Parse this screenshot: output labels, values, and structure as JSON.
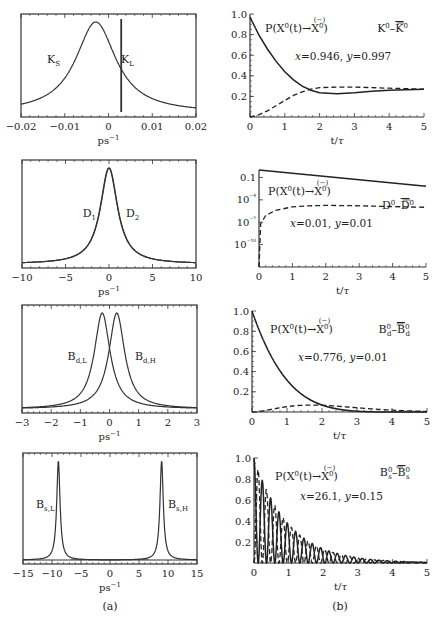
{
  "figure": {
    "caption_a": "(a)",
    "caption_b": "(b)"
  },
  "chart_data": [
    {
      "id": "a1",
      "type": "line",
      "panel": "(a)",
      "xlabel": "ps⁻¹",
      "ylabel": "",
      "xlim": [
        -0.02,
        0.02
      ],
      "xticks": [
        -0.02,
        -0.01,
        0,
        0.01,
        0.02
      ],
      "xtick_labels": [
        "−0.02",
        "−0.01",
        "0",
        "0.01",
        "0.02"
      ],
      "grid": false,
      "series": [
        {
          "name": "K_S",
          "label": "K",
          "sub": "S",
          "kind": "lorentzian",
          "center": -0.0029,
          "halfwidth": 0.0056
        },
        {
          "name": "K_L",
          "label": "K",
          "sub": "L",
          "kind": "lorentzian",
          "center": 0.0029,
          "halfwidth": 1e-05
        }
      ]
    },
    {
      "id": "b1",
      "type": "line",
      "panel": "(b)",
      "title": "K⁰–K̄⁰",
      "formula": "P(X⁰(t)→X⁰)",
      "params": "x=0.946, y=0.997",
      "xlabel": "t/τ",
      "xlim": [
        0,
        5
      ],
      "ylim": [
        0,
        1.0
      ],
      "xticks": [
        0,
        1,
        2,
        3,
        4,
        5
      ],
      "yticks": [
        0.2,
        0.4,
        0.6,
        0.8,
        1.0
      ],
      "ytick_labels": [
        "0.2",
        "0.4",
        "0.6",
        "0.8",
        "1.0"
      ],
      "series": [
        {
          "name": "P(X⁰→X⁰)",
          "style": "solid",
          "x": [
            0,
            0.25,
            0.5,
            0.75,
            1.0,
            1.25,
            1.5,
            1.75,
            2.0,
            2.5,
            3.0,
            3.5,
            4.0,
            4.5,
            5.0
          ],
          "y": [
            0.97,
            0.8,
            0.66,
            0.54,
            0.44,
            0.36,
            0.3,
            0.26,
            0.235,
            0.225,
            0.235,
            0.25,
            0.26,
            0.265,
            0.27
          ]
        },
        {
          "name": "P(X⁰→X̄⁰)",
          "style": "dashed",
          "x": [
            0,
            0.25,
            0.5,
            0.75,
            1.0,
            1.25,
            1.5,
            1.75,
            2.0,
            2.5,
            3.0,
            3.5,
            4.0,
            4.5,
            5.0
          ],
          "y": [
            0.0,
            0.02,
            0.06,
            0.11,
            0.16,
            0.21,
            0.245,
            0.27,
            0.285,
            0.29,
            0.29,
            0.285,
            0.28,
            0.275,
            0.27
          ]
        }
      ]
    },
    {
      "id": "a2",
      "type": "line",
      "panel": "(a)",
      "xlabel": "ps⁻¹",
      "xlim": [
        -10,
        10
      ],
      "xticks": [
        -10,
        -5,
        0,
        5,
        10
      ],
      "xtick_labels": [
        "−10",
        "−5",
        "0",
        "5",
        "10"
      ],
      "series": [
        {
          "name": "D_1",
          "label": "D",
          "sub": "1",
          "kind": "lorentzian",
          "center": -0.02,
          "halfwidth": 1.2
        },
        {
          "name": "D_2",
          "label": "D",
          "sub": "2",
          "kind": "lorentzian",
          "center": 0.02,
          "halfwidth": 1.2
        }
      ]
    },
    {
      "id": "b2",
      "type": "line",
      "panel": "(b)",
      "title": "D⁰–D̄⁰",
      "formula": "P(X⁰(t)→X⁰)",
      "params": "x=0.01, y=0.01",
      "xlabel": "t/τ",
      "yscale": "log",
      "xlim": [
        0,
        5
      ],
      "ylim_log10": [
        -13,
        0
      ],
      "xticks": [
        0,
        1,
        2,
        3,
        4,
        5
      ],
      "yticks_log10": [
        -1,
        -4,
        -7,
        -10
      ],
      "ytick_labels": [
        "0.1",
        "10⁻⁴",
        "10⁻⁷",
        "10⁻¹⁰"
      ],
      "series": [
        {
          "name": "P(X⁰→X⁰)",
          "style": "solid",
          "x": [
            0,
            5
          ],
          "log10_y": [
            0,
            -2.17
          ]
        },
        {
          "name": "P(X⁰→X̄⁰)",
          "style": "dashed",
          "x": [
            0,
            0.05,
            0.2,
            0.5,
            1.0,
            1.5,
            2.0,
            3.0,
            4.0,
            5.0
          ],
          "log10_y": [
            -13,
            -7.2,
            -6.1,
            -5.4,
            -4.95,
            -4.8,
            -4.75,
            -4.8,
            -4.9,
            -5.0
          ]
        }
      ]
    },
    {
      "id": "a3",
      "type": "line",
      "panel": "(a)",
      "xlabel": "ps⁻¹",
      "xlim": [
        -3,
        3
      ],
      "xticks": [
        -3,
        -2,
        -1,
        0,
        1,
        2,
        3
      ],
      "xtick_labels": [
        "−3",
        "−2",
        "−1",
        "0",
        "1",
        "2",
        "3"
      ],
      "series": [
        {
          "name": "B_d,L",
          "label": "B",
          "sub": "d,L",
          "kind": "lorentzian",
          "center": -0.25,
          "halfwidth": 0.33
        },
        {
          "name": "B_d,H",
          "label": "B",
          "sub": "d,H",
          "kind": "lorentzian",
          "center": 0.25,
          "halfwidth": 0.33
        }
      ]
    },
    {
      "id": "b3",
      "type": "line",
      "panel": "(b)",
      "title": "B⁰d–B̄⁰d",
      "formula": "P(X⁰(t)→X⁰)",
      "params": "x=0.776, y=0.01",
      "xlabel": "t/τ",
      "xlim": [
        0,
        5
      ],
      "ylim": [
        0,
        1.0
      ],
      "xticks": [
        0,
        1,
        2,
        3,
        4,
        5
      ],
      "yticks": [
        0.2,
        0.4,
        0.6,
        0.8,
        1.0
      ],
      "ytick_labels": [
        "0.2",
        "0.4",
        "0.6",
        "0.8",
        "1.0"
      ],
      "series": [
        {
          "name": "P(X⁰→X⁰)",
          "style": "solid",
          "kind": "mix",
          "x_param": 0.776,
          "sign": 1
        },
        {
          "name": "P(X⁰→X̄⁰)",
          "style": "dashed",
          "kind": "mix",
          "x_param": 0.776,
          "sign": -1
        }
      ]
    },
    {
      "id": "a4",
      "type": "line",
      "panel": "(a)",
      "xlabel": "ps⁻¹",
      "xlim": [
        -15,
        15
      ],
      "xticks": [
        -15,
        -10,
        -5,
        0,
        5,
        10,
        15
      ],
      "xtick_labels": [
        "−15",
        "−10",
        "−5",
        "0",
        "5",
        "10",
        "15"
      ],
      "series": [
        {
          "name": "B_s,L",
          "label": "B",
          "sub": "s,L",
          "kind": "lorentzian",
          "center": -8.9,
          "halfwidth": 0.35
        },
        {
          "name": "B_s,H",
          "label": "B",
          "sub": "s,H",
          "kind": "lorentzian",
          "center": 8.9,
          "halfwidth": 0.35
        }
      ]
    },
    {
      "id": "b4",
      "type": "line",
      "panel": "(b)",
      "title": "B⁰s–B̄⁰s",
      "formula": "P(X⁰(t)→X⁰)",
      "params": "x=26.1, y=0.15",
      "xlabel": "t/τ",
      "xlim": [
        0,
        5
      ],
      "ylim": [
        0,
        1.0
      ],
      "xticks": [
        0,
        1,
        2,
        3,
        4,
        5
      ],
      "yticks": [
        0.2,
        0.4,
        0.6,
        0.8,
        1.0
      ],
      "ytick_labels": [
        "0.2",
        "0.4",
        "0.6",
        "0.8",
        "1.0"
      ],
      "series": [
        {
          "name": "P(X⁰→X⁰)",
          "style": "solid",
          "kind": "mix",
          "x_param": 26.1,
          "sign": 1
        },
        {
          "name": "P(X⁰→X̄⁰)",
          "style": "dashed",
          "kind": "mix",
          "x_param": 26.1,
          "sign": -1
        }
      ]
    }
  ],
  "layout": {
    "frames": [
      {
        "id": "a1",
        "x0": 21,
        "y0": 14,
        "x1": 196,
        "y1": 117
      },
      {
        "id": "b1",
        "x0": 250,
        "y0": 14,
        "x1": 424,
        "y1": 117
      },
      {
        "id": "a2",
        "x0": 22,
        "y0": 160,
        "x1": 196,
        "y1": 268
      },
      {
        "id": "b2",
        "x0": 259,
        "y0": 170,
        "x1": 426,
        "y1": 267
      },
      {
        "id": "a3",
        "x0": 22,
        "y0": 305,
        "x1": 197,
        "y1": 413
      },
      {
        "id": "b3",
        "x0": 252,
        "y0": 311,
        "x1": 427,
        "y1": 412
      },
      {
        "id": "a4",
        "x0": 23,
        "y0": 453,
        "x1": 197,
        "y1": 564
      },
      {
        "id": "b4",
        "x0": 254,
        "y0": 458,
        "x1": 427,
        "y1": 563
      }
    ]
  }
}
